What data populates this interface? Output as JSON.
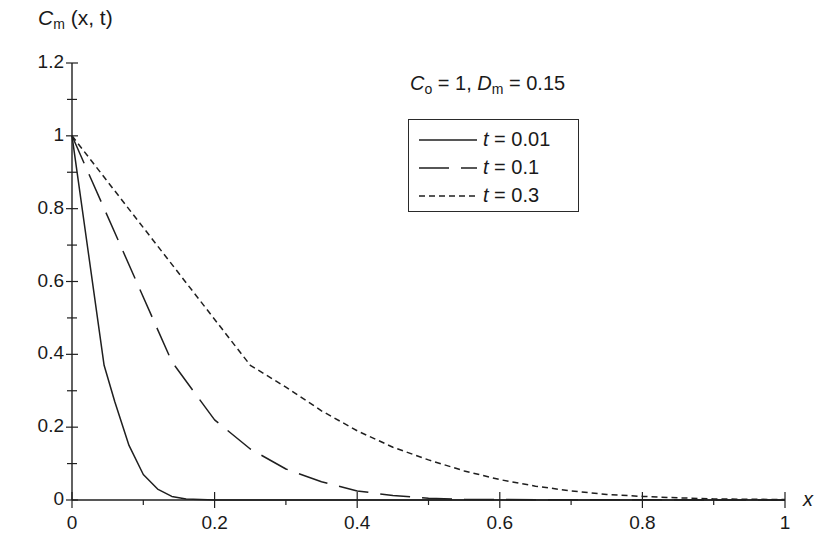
{
  "chart_data": {
    "type": "line",
    "title": "",
    "ylabel": "C_m (x, t)",
    "xlabel": "x",
    "annotation": "C_o = 1, D_m = 0.15",
    "xlim": [
      0,
      1
    ],
    "ylim": [
      0,
      1.2
    ],
    "x_ticks": [
      "0",
      "0.2",
      "0.4",
      "0.6",
      "0.8",
      "1"
    ],
    "y_ticks": [
      "0",
      "0.2",
      "0.4",
      "0.6",
      "0.8",
      "1",
      "1.2"
    ],
    "grid": false,
    "legend_position": "upper center",
    "series": [
      {
        "name": "t = 0.01",
        "style": "solid",
        "x": [
          0,
          0.045,
          0.06,
          0.08,
          0.1,
          0.12,
          0.14,
          0.16,
          0.2,
          1.0
        ],
        "y": [
          1,
          0.37,
          0.27,
          0.15,
          0.07,
          0.03,
          0.01,
          0.003,
          0,
          0
        ]
      },
      {
        "name": "t = 0.1",
        "style": "dashed",
        "x": [
          0,
          0.14,
          0.17,
          0.2,
          0.25,
          0.3,
          0.35,
          0.4,
          0.45,
          0.5,
          0.55,
          0.6,
          1.0
        ],
        "y": [
          1,
          0.38,
          0.3,
          0.22,
          0.14,
          0.085,
          0.05,
          0.025,
          0.012,
          0.005,
          0.002,
          0.001,
          0
        ]
      },
      {
        "name": "t = 0.3",
        "style": "dotted",
        "x": [
          0,
          0.25,
          0.3,
          0.35,
          0.4,
          0.45,
          0.5,
          0.55,
          0.6,
          0.65,
          0.7,
          0.75,
          0.8,
          0.85,
          0.9,
          1.0
        ],
        "y": [
          1,
          0.37,
          0.31,
          0.245,
          0.19,
          0.145,
          0.11,
          0.08,
          0.056,
          0.038,
          0.025,
          0.015,
          0.01,
          0.006,
          0.003,
          0.001
        ]
      }
    ]
  },
  "labels": {
    "y_axis_main": "C",
    "y_axis_sub": "m",
    "y_axis_rest": " (x, t)",
    "x_axis": "x",
    "param_c": "C",
    "param_c_sub": "o",
    "param_mid": " = 1, ",
    "param_d": "D",
    "param_d_sub": "m",
    "param_end": " = 0.15"
  },
  "legend": [
    {
      "var": "t",
      "text": " = 0.01"
    },
    {
      "var": "t",
      "text": " = 0.1"
    },
    {
      "var": "t",
      "text": " = 0.3"
    }
  ],
  "colors": {
    "ink": "#1f1f1f",
    "background": "#ffffff"
  }
}
